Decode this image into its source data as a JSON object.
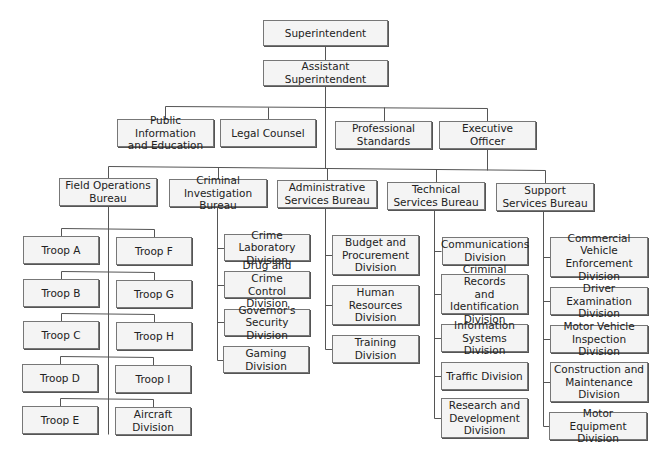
{
  "diagram": {
    "type": "org-chart",
    "nodes": [
      {
        "id": "superintendent",
        "label": "Superintendent",
        "x": 263,
        "y": 20,
        "w": 125,
        "h": 26
      },
      {
        "id": "assistant-superintendent",
        "label": "Assistant Superintendent",
        "x": 263,
        "y": 60,
        "w": 125,
        "h": 26
      },
      {
        "id": "public-information",
        "label": "Public Information\nand Education",
        "x": 117,
        "y": 119,
        "w": 97,
        "h": 28
      },
      {
        "id": "legal-counsel",
        "label": "Legal Counsel",
        "x": 220,
        "y": 119,
        "w": 96,
        "h": 28
      },
      {
        "id": "professional-standards",
        "label": "Professional\nStandards",
        "x": 335,
        "y": 121,
        "w": 97,
        "h": 28
      },
      {
        "id": "executive-officer",
        "label": "Executive\nOfficer",
        "x": 439,
        "y": 121,
        "w": 97,
        "h": 28
      },
      {
        "id": "field-operations",
        "label": "Field Operations\nBureau",
        "x": 59,
        "y": 178,
        "w": 98,
        "h": 28
      },
      {
        "id": "criminal-investigation",
        "label": "Criminal\nInvestigation Bureau",
        "x": 169,
        "y": 179,
        "w": 98,
        "h": 28
      },
      {
        "id": "administrative-services",
        "label": "Administrative\nServices Bureau",
        "x": 277,
        "y": 180,
        "w": 100,
        "h": 28
      },
      {
        "id": "technical-services",
        "label": "Technical\nServices Bureau",
        "x": 387,
        "y": 182,
        "w": 98,
        "h": 28
      },
      {
        "id": "support-services",
        "label": "Support\nServices Bureau",
        "x": 496,
        "y": 183,
        "w": 98,
        "h": 28
      },
      {
        "id": "troop-a",
        "label": "Troop A",
        "x": 23,
        "y": 236,
        "w": 76,
        "h": 28
      },
      {
        "id": "troop-f",
        "label": "Troop F",
        "x": 116,
        "y": 237,
        "w": 76,
        "h": 28
      },
      {
        "id": "troop-b",
        "label": "Troop B",
        "x": 23,
        "y": 279,
        "w": 76,
        "h": 28
      },
      {
        "id": "troop-g",
        "label": "Troop G",
        "x": 116,
        "y": 280,
        "w": 76,
        "h": 28
      },
      {
        "id": "troop-c",
        "label": "Troop C",
        "x": 23,
        "y": 321,
        "w": 76,
        "h": 28
      },
      {
        "id": "troop-h",
        "label": "Troop H",
        "x": 116,
        "y": 322,
        "w": 76,
        "h": 28
      },
      {
        "id": "troop-d",
        "label": "Troop D",
        "x": 22,
        "y": 364,
        "w": 76,
        "h": 28
      },
      {
        "id": "troop-i",
        "label": "Troop I",
        "x": 115,
        "y": 365,
        "w": 76,
        "h": 28
      },
      {
        "id": "troop-e",
        "label": "Troop E",
        "x": 22,
        "y": 406,
        "w": 76,
        "h": 28
      },
      {
        "id": "aircraft-division",
        "label": "Aircraft Division",
        "x": 115,
        "y": 407,
        "w": 76,
        "h": 28
      },
      {
        "id": "crime-laboratory",
        "label": "Crime Laboratory\nDivision",
        "x": 224,
        "y": 234,
        "w": 86,
        "h": 27
      },
      {
        "id": "drug-crime-control",
        "label": "Drug and Crime\nControl Division",
        "x": 224,
        "y": 271,
        "w": 86,
        "h": 27
      },
      {
        "id": "governors-security",
        "label": "Governor's\nSecurity Division",
        "x": 224,
        "y": 309,
        "w": 86,
        "h": 27
      },
      {
        "id": "gaming-division",
        "label": "Gaming Division",
        "x": 223,
        "y": 346,
        "w": 86,
        "h": 27
      },
      {
        "id": "budget-procurement",
        "label": "Budget and\nProcurement\nDivision",
        "x": 332,
        "y": 235,
        "w": 87,
        "h": 40
      },
      {
        "id": "human-resources",
        "label": "Human\nResources\nDivision",
        "x": 332,
        "y": 285,
        "w": 87,
        "h": 40
      },
      {
        "id": "training-division",
        "label": "Training Division",
        "x": 332,
        "y": 335,
        "w": 87,
        "h": 28
      },
      {
        "id": "communications",
        "label": "Communications\nDivision",
        "x": 442,
        "y": 237,
        "w": 86,
        "h": 28
      },
      {
        "id": "criminal-records",
        "label": "Criminal Records\nand Identification\nDivision",
        "x": 441,
        "y": 274,
        "w": 87,
        "h": 40
      },
      {
        "id": "information-systems",
        "label": "Information\nSystems Division",
        "x": 441,
        "y": 324,
        "w": 87,
        "h": 28
      },
      {
        "id": "traffic-division",
        "label": "Traffic Division",
        "x": 441,
        "y": 362,
        "w": 87,
        "h": 28
      },
      {
        "id": "research-development",
        "label": "Research and\nDevelopment\nDivision",
        "x": 441,
        "y": 398,
        "w": 87,
        "h": 40
      },
      {
        "id": "commercial-vehicle",
        "label": "Commercial Vehicle\nEnforcement\nDivision",
        "x": 550,
        "y": 237,
        "w": 98,
        "h": 40
      },
      {
        "id": "driver-examination",
        "label": "Driver Examination\nDivision",
        "x": 550,
        "y": 287,
        "w": 98,
        "h": 28
      },
      {
        "id": "motor-vehicle-inspection",
        "label": "Motor Vehicle\nInspection Division",
        "x": 550,
        "y": 325,
        "w": 98,
        "h": 28
      },
      {
        "id": "construction-maintenance",
        "label": "Construction and\nMaintenance\nDivision",
        "x": 550,
        "y": 362,
        "w": 98,
        "h": 40
      },
      {
        "id": "motor-equipment",
        "label": "Motor Equipment\nDivision",
        "x": 549,
        "y": 412,
        "w": 98,
        "h": 28
      }
    ],
    "lines": [
      [
        325,
        46,
        325,
        60
      ],
      [
        325,
        86,
        325,
        168
      ],
      [
        165,
        106,
        487,
        108
      ],
      [
        165,
        106,
        165,
        119
      ],
      [
        268,
        107,
        268,
        119
      ],
      [
        384,
        107,
        384,
        121
      ],
      [
        487,
        108,
        487,
        121
      ],
      [
        487,
        149,
        487,
        170
      ],
      [
        108,
        166,
        545,
        170
      ],
      [
        108,
        166,
        108,
        178
      ],
      [
        218,
        167,
        218,
        179
      ],
      [
        327,
        168,
        327,
        180
      ],
      [
        436,
        169,
        436,
        182
      ],
      [
        545,
        170,
        545,
        183
      ],
      [
        108,
        206,
        108,
        434
      ],
      [
        61,
        228,
        154,
        229
      ],
      [
        61,
        228,
        61,
        236
      ],
      [
        154,
        229,
        154,
        237
      ],
      [
        61,
        271,
        154,
        272
      ],
      [
        61,
        271,
        61,
        279
      ],
      [
        154,
        272,
        154,
        280
      ],
      [
        61,
        313,
        154,
        314
      ],
      [
        61,
        313,
        61,
        321
      ],
      [
        154,
        314,
        154,
        322
      ],
      [
        60,
        356,
        153,
        357
      ],
      [
        60,
        356,
        60,
        364
      ],
      [
        153,
        357,
        153,
        365
      ],
      [
        60,
        398,
        153,
        399
      ],
      [
        60,
        398,
        60,
        406
      ],
      [
        153,
        399,
        153,
        407
      ],
      [
        217,
        207,
        217,
        360
      ],
      [
        217,
        248,
        224,
        248
      ],
      [
        217,
        285,
        224,
        285
      ],
      [
        217,
        322,
        224,
        322
      ],
      [
        217,
        360,
        223,
        360
      ],
      [
        325,
        208,
        325,
        349
      ],
      [
        325,
        255,
        332,
        255
      ],
      [
        325,
        305,
        332,
        305
      ],
      [
        325,
        349,
        332,
        349
      ],
      [
        434,
        210,
        434,
        418
      ],
      [
        434,
        251,
        441,
        251
      ],
      [
        434,
        294,
        441,
        294
      ],
      [
        434,
        338,
        441,
        338
      ],
      [
        434,
        376,
        441,
        376
      ],
      [
        434,
        418,
        441,
        418
      ],
      [
        543,
        211,
        543,
        426
      ],
      [
        543,
        257,
        550,
        257
      ],
      [
        543,
        301,
        550,
        301
      ],
      [
        543,
        339,
        550,
        339
      ],
      [
        543,
        382,
        550,
        382
      ],
      [
        543,
        426,
        549,
        426
      ]
    ]
  }
}
